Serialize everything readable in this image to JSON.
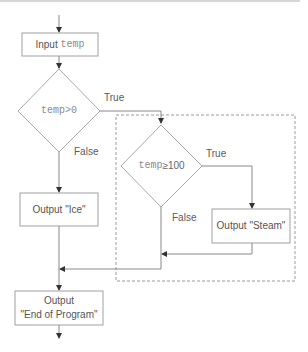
{
  "flowchart": {
    "nodes": {
      "input": {
        "prefix": "Input ",
        "var": "temp"
      },
      "decision1": {
        "var": "temp",
        "op": ">0"
      },
      "decision2": {
        "var": "temp",
        "op": "≥100"
      },
      "output_ice": {
        "label": "Output \"Ice\""
      },
      "output_steam": {
        "label": "Output \"Steam\""
      },
      "output_end": {
        "line1": "Output",
        "line2": "\"End of Program\""
      }
    },
    "edges": {
      "d1_true": "True",
      "d1_false": "False",
      "d2_true": "True",
      "d2_false": "False"
    },
    "colors": {
      "stroke": "#a0a0a0",
      "arrow": "#333333",
      "dashed": "#9a9a9a",
      "text": "#555555",
      "code_text": "#8a8a8a"
    }
  }
}
